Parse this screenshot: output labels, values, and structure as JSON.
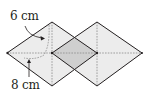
{
  "figure": {
    "labels": {
      "top_dimension": "6 cm",
      "bottom_dimension": "8 cm"
    },
    "colors": {
      "face_fill": "#ececec",
      "shaded_fill": "#cfcfcf",
      "edge": "#231f20",
      "fold_line": "#8a8a8a"
    }
  }
}
